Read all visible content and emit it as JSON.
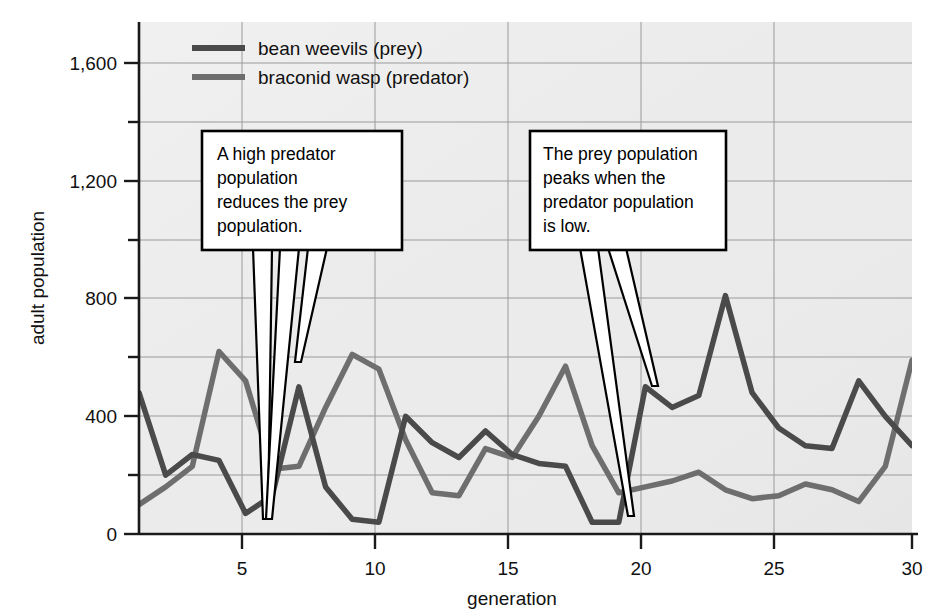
{
  "chart_data": {
    "type": "line",
    "title": "",
    "xlabel": "generation",
    "ylabel": "adult population",
    "xlim": [
      1,
      30
    ],
    "ylim": [
      0,
      1700
    ],
    "x": [
      1,
      2,
      3,
      4,
      5,
      6,
      7,
      8,
      9,
      10,
      11,
      12,
      13,
      14,
      15,
      16,
      17,
      18,
      19,
      20,
      21,
      22,
      23,
      24,
      25,
      26,
      27,
      28,
      29,
      30
    ],
    "xticks": [
      5,
      10,
      15,
      20,
      25,
      30
    ],
    "xtick_labels": [
      "5",
      "10",
      "15",
      "20",
      "25",
      "30"
    ],
    "yticks": [
      0,
      200,
      400,
      600,
      800,
      1000,
      1200,
      1400,
      1600
    ],
    "ytick_labels": [
      "0",
      "",
      "400",
      "",
      "800",
      "",
      "1,200",
      "",
      "1,600"
    ],
    "grid": true,
    "legend_position": "top-center",
    "series": [
      {
        "name": "bean weevils (prey)",
        "color": "#4a4a4a",
        "values": [
          480,
          200,
          270,
          250,
          70,
          130,
          500,
          160,
          50,
          40,
          400,
          310,
          260,
          350,
          270,
          240,
          230,
          40,
          40,
          500,
          430,
          470,
          810,
          480,
          360,
          300,
          290,
          520,
          400,
          300
        ]
      },
      {
        "name": "braconid wasp (predator)",
        "color": "#6e6e6e",
        "values": [
          100,
          160,
          230,
          620,
          520,
          220,
          230,
          430,
          610,
          560,
          320,
          140,
          130,
          290,
          260,
          400,
          570,
          300,
          140,
          160,
          180,
          210,
          150,
          120,
          130,
          170,
          150,
          110,
          230,
          590
        ]
      }
    ],
    "annotations": [
      {
        "id": "callout-predator-reduces-prey",
        "text": "A high predator\npopulation\nreduces the prey\npopulation.",
        "lines": [
          "A high predator",
          "population",
          "reduces the prey",
          "population."
        ],
        "box": {
          "x": 202,
          "y": 131,
          "w": 200,
          "h": 119
        },
        "pointers": [
          {
            "x": 263,
            "y": 519
          },
          {
            "x": 263,
            "y": 519
          },
          {
            "x": 296,
            "y": 362
          }
        ]
      },
      {
        "id": "callout-prey-peaks",
        "text": "The prey population\npeaks when the\npredator population\nis low.",
        "lines": [
          "The prey population",
          "peaks when the",
          "predator population",
          "is low."
        ],
        "box": {
          "x": 530,
          "y": 131,
          "w": 196,
          "h": 119
        },
        "pointers": [
          {
            "x": 629,
            "y": 516
          },
          {
            "x": 655,
            "y": 386
          }
        ]
      }
    ]
  },
  "legend": {
    "items": [
      {
        "label": "bean weevils (prey)",
        "color": "#4a4a4a"
      },
      {
        "label": "braconid wasp (predator)",
        "color": "#6e6e6e"
      }
    ]
  },
  "axes": {
    "ylabel": "adult population",
    "xlabel": "generation",
    "y_tick_labels": [
      "1,600",
      "1,200",
      "800",
      "400",
      "0"
    ],
    "x_tick_labels": [
      "5",
      "10",
      "15",
      "20",
      "25",
      "30"
    ]
  },
  "colors": {
    "plot_background": "#eaeaea",
    "grid": "#9a9a9a",
    "axis": "#1a1a1a",
    "prey": "#4a4a4a",
    "predator": "#6e6e6e",
    "callout_fill": "#ffffff",
    "callout_stroke": "#000000"
  }
}
